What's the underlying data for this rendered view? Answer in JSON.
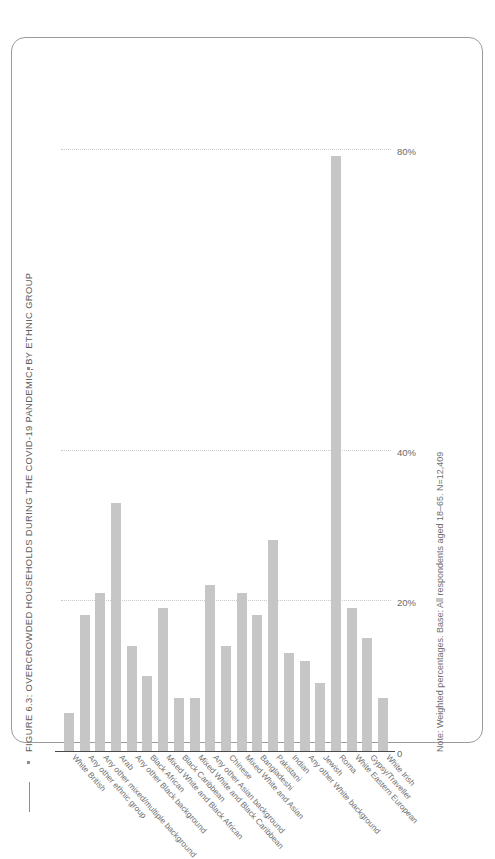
{
  "figure": {
    "title": "FIGURE 6.3: OVERCROWDED HOUSEHOLDS DURING THE COVID-19 PANDEMIC, BY ETHNIC GROUP",
    "note": "Note: Weighted percentages. Base: All respondents aged 18–65. N=12,409"
  },
  "chart_data": {
    "type": "bar",
    "orientation": "horizontal",
    "title": "FIGURE 6.3: OVERCROWDED HOUSEHOLDS DURING THE COVID-19 PANDEMIC, BY ETHNIC GROUP",
    "xlabel": "",
    "ylabel": "",
    "xlim": [
      0,
      85
    ],
    "grid": true,
    "legend": false,
    "bar_color": "#c6c6c6",
    "tick_labels": [
      "0",
      "20%",
      "40%",
      "80%"
    ],
    "tick_values": [
      0,
      20,
      40,
      80
    ],
    "categories": [
      "White British",
      "Any other ethnic group",
      "Any other mixed/multiple background",
      "Arab",
      "Any other Black background",
      "Black African",
      "Mixed White and Black African",
      "Black Caribbean",
      "Mixed White and Black Caribbean",
      "Any other Asian background",
      "Chinese",
      "Mixed White and Asian",
      "Bangladeshi",
      "Pakistani",
      "Indian",
      "Any other White background",
      "Jewish",
      "Roma",
      "White Eastern European",
      "Gypsy/Traveller",
      "White Irish"
    ],
    "values": [
      5,
      18,
      21,
      33,
      14,
      10,
      19,
      7,
      7,
      22,
      14,
      21,
      18,
      28,
      13,
      12,
      9,
      79,
      19,
      15,
      7
    ]
  }
}
